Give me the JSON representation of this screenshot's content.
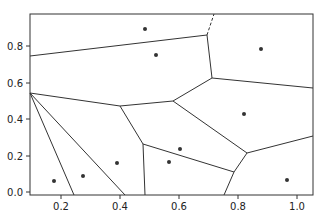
{
  "figure": {
    "type": "voronoi_diagram",
    "axes": {
      "xlim": [
        0.095,
        1.054
      ],
      "ylim": [
        -0.016,
        0.978
      ],
      "xticks": [
        "0.2",
        "0.4",
        "0.6",
        "0.8",
        "1.0"
      ],
      "yticks": [
        "0.0",
        "0.2",
        "0.4",
        "0.6",
        "0.8"
      ]
    },
    "points": [
      {
        "x": 0.49,
        "y": 0.89
      },
      {
        "x": 0.53,
        "y": 0.75
      },
      {
        "x": 0.88,
        "y": 0.78
      },
      {
        "x": 0.82,
        "y": 0.43
      },
      {
        "x": 0.61,
        "y": 0.24
      },
      {
        "x": 0.57,
        "y": 0.16
      },
      {
        "x": 0.39,
        "y": 0.16
      },
      {
        "x": 0.27,
        "y": 0.09
      },
      {
        "x": 0.17,
        "y": 0.06
      },
      {
        "x": 0.96,
        "y": 0.07
      }
    ],
    "ridge_style": {
      "finite": "solid",
      "infinite_dashed_example": "top ridge near x=0.72"
    },
    "colors": {
      "line": "#333333",
      "point": "#333333",
      "frame": "#333333"
    }
  }
}
